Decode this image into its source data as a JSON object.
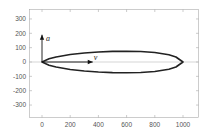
{
  "chart_data": {
    "type": "line",
    "title": "",
    "xlabel": "",
    "ylabel": "",
    "xlim": [
      -90,
      1100
    ],
    "ylim": [
      -375,
      375
    ],
    "grid": false,
    "xticks": [
      0,
      200,
      400,
      600,
      800,
      1000
    ],
    "yticks": [
      -300,
      -200,
      -100,
      0,
      100,
      200,
      300
    ],
    "xtick_labels": [
      "0",
      "200",
      "400",
      "600",
      "800",
      "1000"
    ],
    "ytick_labels": [
      "-300",
      "-200",
      "-100",
      "0",
      "100",
      "200",
      "300"
    ],
    "series": [
      {
        "name": "upper-curve",
        "x": [
          0,
          50,
          100,
          200,
          300,
          400,
          500,
          600,
          700,
          800,
          900,
          950,
          1000
        ],
        "y": [
          0,
          22,
          35,
          52,
          63,
          70,
          74,
          75,
          73,
          66,
          50,
          35,
          0
        ]
      },
      {
        "name": "lower-curve",
        "x": [
          0,
          50,
          100,
          200,
          300,
          400,
          500,
          600,
          700,
          800,
          900,
          950,
          1000
        ],
        "y": [
          0,
          -22,
          -35,
          -52,
          -63,
          -70,
          -74,
          -75,
          -73,
          -66,
          -50,
          -35,
          0
        ]
      }
    ],
    "annotations": [
      {
        "type": "arrow",
        "label": "a",
        "from": [
          0,
          0
        ],
        "to": [
          0,
          190
        ]
      },
      {
        "type": "arrow",
        "label": "v",
        "from": [
          0,
          0
        ],
        "to": [
          360,
          0
        ]
      }
    ],
    "reference_lines": [
      {
        "axis": "y",
        "value": 0,
        "color": "#bbbbbb"
      }
    ]
  }
}
